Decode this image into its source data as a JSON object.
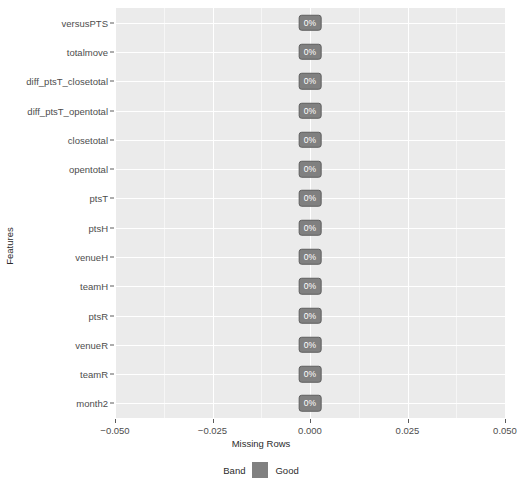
{
  "chart_data": {
    "type": "scatter",
    "title": "",
    "xlabel": "Missing Rows",
    "ylabel": "Features",
    "xlim": [
      -0.05,
      0.05
    ],
    "grid": true,
    "legend_position": "bottom",
    "x_ticks": [
      "-0.050",
      "-0.025",
      "0.000",
      "0.025",
      "0.050"
    ],
    "x_tick_values": [
      -0.05,
      -0.025,
      0,
      0.025,
      0.05
    ],
    "categories": [
      "versusPTS",
      "totalmove",
      "diff_ptsT_closetotal",
      "diff_ptsT_opentotal",
      "closetotal",
      "opentotal",
      "ptsT",
      "ptsH",
      "venueH",
      "teamH",
      "ptsR",
      "venueR",
      "teamR",
      "month2"
    ],
    "values": [
      0,
      0,
      0,
      0,
      0,
      0,
      0,
      0,
      0,
      0,
      0,
      0,
      0,
      0
    ],
    "point_labels": [
      "0%",
      "0%",
      "0%",
      "0%",
      "0%",
      "0%",
      "0%",
      "0%",
      "0%",
      "0%",
      "0%",
      "0%",
      "0%",
      "0%"
    ],
    "legend": {
      "title": "Band",
      "entries": [
        {
          "label": "Good",
          "color": "#808080"
        }
      ]
    },
    "colors": {
      "panel_background": "#ebebeb",
      "gridline": "#ffffff",
      "point_fill": "#808080",
      "point_border": "#5e5e5e",
      "label_text": "#ffffff",
      "axis_text": "#4d4d4d",
      "axis_title": "#2b2b2b",
      "page_background": "#ffffff"
    }
  }
}
